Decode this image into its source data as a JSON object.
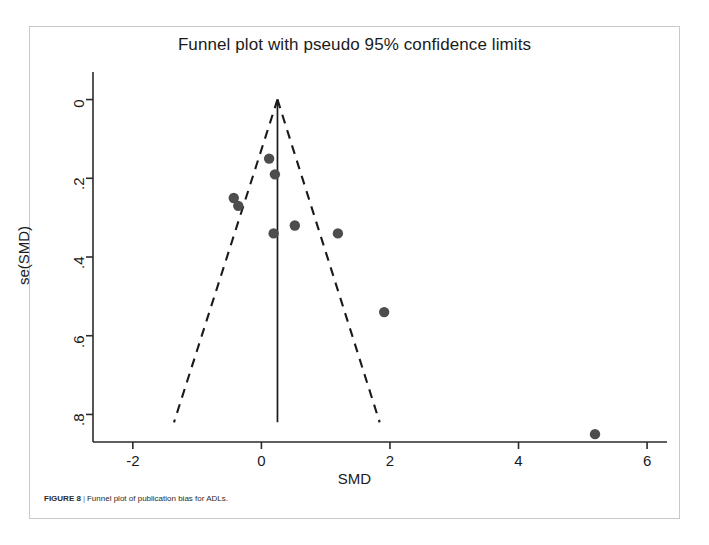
{
  "figure": {
    "caption_label": "FIGURE 8",
    "caption_separator": "|",
    "caption_text": "Funnel plot of publication bias for ADLs."
  },
  "colors": {
    "marker": "#4d4d4d",
    "axis": "#2b2b2b",
    "dashed_line": "#1a1a1a",
    "frame": "#c9c9c9",
    "text": "#1b1b1b"
  },
  "chart_data": {
    "type": "scatter",
    "title": "Funnel plot with pseudo 95% confidence limits",
    "xlabel": "SMD",
    "ylabel": "se(SMD)",
    "xlim": [
      -2.62,
      6.31
    ],
    "ylim": [
      -0.07,
      0.87
    ],
    "y_inverted": true,
    "grid": false,
    "legend": "none",
    "xticks": [
      -2,
      0,
      2,
      4,
      6
    ],
    "xtick_labels": [
      "-2",
      "0",
      "2",
      "4",
      "6"
    ],
    "yticks": [
      0,
      0.2,
      0.4,
      0.6,
      0.8
    ],
    "ytick_labels": [
      "0",
      ".2",
      ".4",
      ".6",
      ".8"
    ],
    "pooled_effect": 0.25,
    "points": [
      {
        "x": 0.12,
        "y": 0.15
      },
      {
        "x": 0.21,
        "y": 0.19
      },
      {
        "x": -0.43,
        "y": 0.25
      },
      {
        "x": -0.36,
        "y": 0.27
      },
      {
        "x": 0.52,
        "y": 0.32
      },
      {
        "x": 0.19,
        "y": 0.34
      },
      {
        "x": 1.19,
        "y": 0.34
      },
      {
        "x": 1.91,
        "y": 0.54
      },
      {
        "x": 5.19,
        "y": 0.85
      }
    ],
    "pseudo_ci_limits": {
      "apex": {
        "x": 0.25,
        "y": 0.0
      },
      "left_foot": {
        "x": -1.36,
        "y": 0.82
      },
      "right_foot": {
        "x": 1.84,
        "y": 0.82
      }
    }
  }
}
